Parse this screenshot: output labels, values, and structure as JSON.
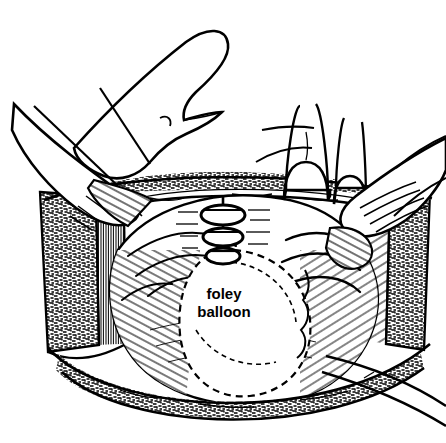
{
  "figure": {
    "style": "black-and-white pen-and-ink line drawing",
    "background_color": "#ffffff",
    "ink_color": "#000000",
    "canvas": {
      "width": 446,
      "height": 443
    }
  },
  "annotations": {
    "balloon_label_line1": "foley",
    "balloon_label_line2": "balloon"
  },
  "elements": {
    "incision_rim": "abdominal wall incision rim",
    "left_wall": "left incision wall with fat and muscle layers",
    "right_wall": "right incision wall with fat and muscle layers",
    "organ": "uterus / bladder dome exposed in the wound",
    "balloon": "inflated foley catheter balloon outline",
    "catheter": "foley catheter tube exiting lower right",
    "sutures": "three suture or clip markers on the midline",
    "hand_upper_left": "surgeon thumb pressing from upper left",
    "hand_left": "assistant hand retracting left edge",
    "finger_center_right": "gloved index finger",
    "finger_right": "gloved middle finger",
    "hand_right": "surgeon hand retracting right edge",
    "retractor_left": "retractor blade handles at upper left"
  }
}
